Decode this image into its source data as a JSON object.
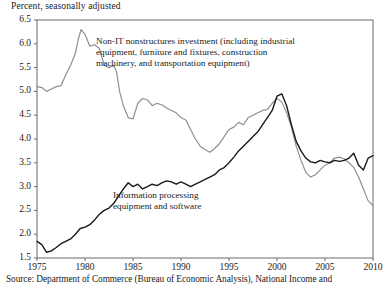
{
  "figure": {
    "axis_title": "Percent, seasonally adjusted",
    "source_note": "Source:  Department of Commerce (Bureau of Economic Analysis), National Income and"
  },
  "annotations": {
    "non_it_line1": "Non-IT nonstructures investment (including industrial",
    "non_it_line2": "equipment, furniture and fixtures, construction",
    "non_it_line3": "machinery, and transportation equipment)",
    "it_line1": "Information processing",
    "it_line2": "equipment and software"
  },
  "colors": {
    "series_non_it": "#8f8f8f",
    "series_it": "#1a1a1a",
    "axis": "#6b6b6b"
  },
  "chart_data": {
    "type": "line",
    "title": "",
    "subtitle": "",
    "xlabel": "",
    "ylabel": "Percent, seasonally adjusted",
    "xlim": [
      1975,
      2010
    ],
    "ylim": [
      1.5,
      6.5
    ],
    "xticks": [
      1975,
      1980,
      1985,
      1990,
      1995,
      2000,
      2005,
      2010
    ],
    "yticks": [
      1.5,
      2.0,
      2.5,
      3.0,
      3.5,
      4.0,
      4.5,
      5.0,
      5.5,
      6.0,
      6.5
    ],
    "grid": false,
    "legend": "none (inline annotations)",
    "series": [
      {
        "name": "Non-IT nonstructures investment (including industrial equipment, furniture and fixtures, construction machinery, and transportation equipment)",
        "color": "#8f8f8f",
        "x": [
          1975.0,
          1975.5,
          1976.0,
          1976.5,
          1977.0,
          1977.5,
          1978.0,
          1978.5,
          1979.0,
          1979.3,
          1979.6,
          1980.0,
          1980.5,
          1981.0,
          1981.5,
          1982.0,
          1982.5,
          1983.0,
          1983.3,
          1983.6,
          1984.0,
          1984.5,
          1985.0,
          1985.5,
          1986.0,
          1986.5,
          1987.0,
          1987.5,
          1988.0,
          1988.5,
          1989.0,
          1989.5,
          1990.0,
          1990.5,
          1991.0,
          1991.5,
          1992.0,
          1992.5,
          1993.0,
          1993.5,
          1994.0,
          1994.5,
          1995.0,
          1995.5,
          1996.0,
          1996.5,
          1997.0,
          1997.5,
          1998.0,
          1998.5,
          1999.0,
          1999.5,
          2000.0,
          2000.5,
          2001.0,
          2001.5,
          2002.0,
          2002.5,
          2003.0,
          2003.5,
          2004.0,
          2004.5,
          2005.0,
          2005.5,
          2006.0,
          2006.5,
          2007.0,
          2007.5,
          2008.0,
          2008.5,
          2009.0,
          2009.5,
          2010.0
        ],
        "y": [
          5.1,
          5.08,
          5.0,
          5.05,
          5.1,
          5.12,
          5.35,
          5.55,
          5.8,
          6.1,
          6.3,
          6.2,
          5.95,
          5.98,
          5.9,
          5.55,
          5.5,
          5.55,
          5.4,
          5.0,
          4.7,
          4.45,
          4.42,
          4.75,
          4.85,
          4.82,
          4.7,
          4.75,
          4.72,
          4.65,
          4.6,
          4.55,
          4.45,
          4.4,
          4.2,
          4.0,
          3.85,
          3.78,
          3.72,
          3.8,
          3.9,
          4.05,
          4.2,
          4.25,
          4.35,
          4.3,
          4.45,
          4.5,
          4.55,
          4.6,
          4.62,
          4.75,
          4.85,
          4.78,
          4.55,
          4.25,
          3.85,
          3.55,
          3.3,
          3.2,
          3.25,
          3.35,
          3.45,
          3.5,
          3.6,
          3.62,
          3.58,
          3.5,
          3.4,
          3.2,
          2.95,
          2.7,
          2.6
        ]
      },
      {
        "name": "Information processing equipment and software",
        "color": "#1a1a1a",
        "x": [
          1975.0,
          1975.5,
          1976.0,
          1976.5,
          1977.0,
          1977.5,
          1978.0,
          1978.5,
          1979.0,
          1979.5,
          1980.0,
          1980.5,
          1981.0,
          1981.5,
          1982.0,
          1982.5,
          1983.0,
          1983.5,
          1984.0,
          1984.5,
          1985.0,
          1985.5,
          1986.0,
          1986.5,
          1987.0,
          1987.5,
          1988.0,
          1988.5,
          1989.0,
          1989.5,
          1990.0,
          1990.5,
          1991.0,
          1991.5,
          1992.0,
          1992.5,
          1993.0,
          1993.5,
          1994.0,
          1994.5,
          1995.0,
          1995.5,
          1996.0,
          1996.5,
          1997.0,
          1997.5,
          1998.0,
          1998.5,
          1999.0,
          1999.5,
          2000.0,
          2000.5,
          2001.0,
          2001.5,
          2002.0,
          2002.5,
          2003.0,
          2003.5,
          2004.0,
          2004.5,
          2005.0,
          2005.5,
          2006.0,
          2006.5,
          2007.0,
          2007.5,
          2008.0,
          2008.5,
          2009.0,
          2009.5,
          2010.0
        ],
        "y": [
          1.85,
          1.78,
          1.62,
          1.65,
          1.72,
          1.8,
          1.85,
          1.9,
          2.0,
          2.12,
          2.15,
          2.2,
          2.3,
          2.42,
          2.5,
          2.55,
          2.65,
          2.8,
          2.95,
          3.08,
          3.0,
          3.05,
          2.95,
          3.0,
          3.05,
          3.02,
          3.08,
          3.12,
          3.1,
          3.05,
          3.1,
          3.05,
          3.0,
          3.05,
          3.1,
          3.15,
          3.2,
          3.25,
          3.35,
          3.4,
          3.5,
          3.62,
          3.75,
          3.85,
          3.95,
          4.05,
          4.15,
          4.3,
          4.45,
          4.6,
          4.9,
          4.95,
          4.7,
          4.3,
          3.95,
          3.75,
          3.6,
          3.52,
          3.5,
          3.55,
          3.52,
          3.5,
          3.55,
          3.53,
          3.55,
          3.6,
          3.7,
          3.45,
          3.35,
          3.6,
          3.65
        ]
      }
    ]
  }
}
